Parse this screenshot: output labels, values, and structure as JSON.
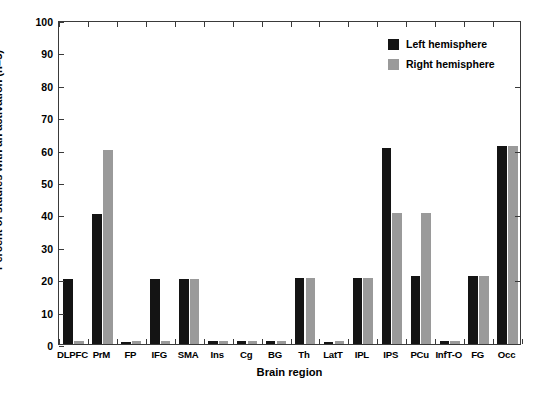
{
  "chart_data": {
    "type": "bar",
    "title": "",
    "xlabel": "Brain region",
    "ylabel": "Percent of studies with an activation (n=5)",
    "ylim": [
      0,
      100
    ],
    "yticks": [
      0,
      10,
      20,
      30,
      40,
      50,
      60,
      70,
      80,
      90,
      100
    ],
    "grid": false,
    "legend_position": "top-right",
    "categories": [
      "DLPFC",
      "PrM",
      "FP",
      "IFG",
      "SMA",
      "Ins",
      "Cg",
      "BG",
      "Th",
      "LatT",
      "IPL",
      "IPS",
      "PCu",
      "InfT-O",
      "FG",
      "Occ"
    ],
    "series": [
      {
        "name": "Left hemisphere",
        "color": "#141414",
        "values": [
          20,
          40,
          0.5,
          20,
          20,
          1,
          1,
          1,
          20.5,
          0.5,
          20.5,
          60.5,
          21,
          1,
          21,
          61
        ]
      },
      {
        "name": "Right hemisphere",
        "color": "#9a9a9a",
        "values": [
          1,
          60,
          1,
          1,
          20,
          1,
          1,
          1,
          20.5,
          1,
          20.5,
          40.5,
          40.5,
          1,
          21,
          61
        ]
      }
    ]
  },
  "legend": {
    "items": [
      {
        "label": "Left hemisphere",
        "color": "#141414"
      },
      {
        "label": "Right hemisphere",
        "color": "#9a9a9a"
      }
    ]
  },
  "axes": {
    "x_label": "Brain region",
    "y_label": "Percent of studies with an activation (n=5)"
  }
}
